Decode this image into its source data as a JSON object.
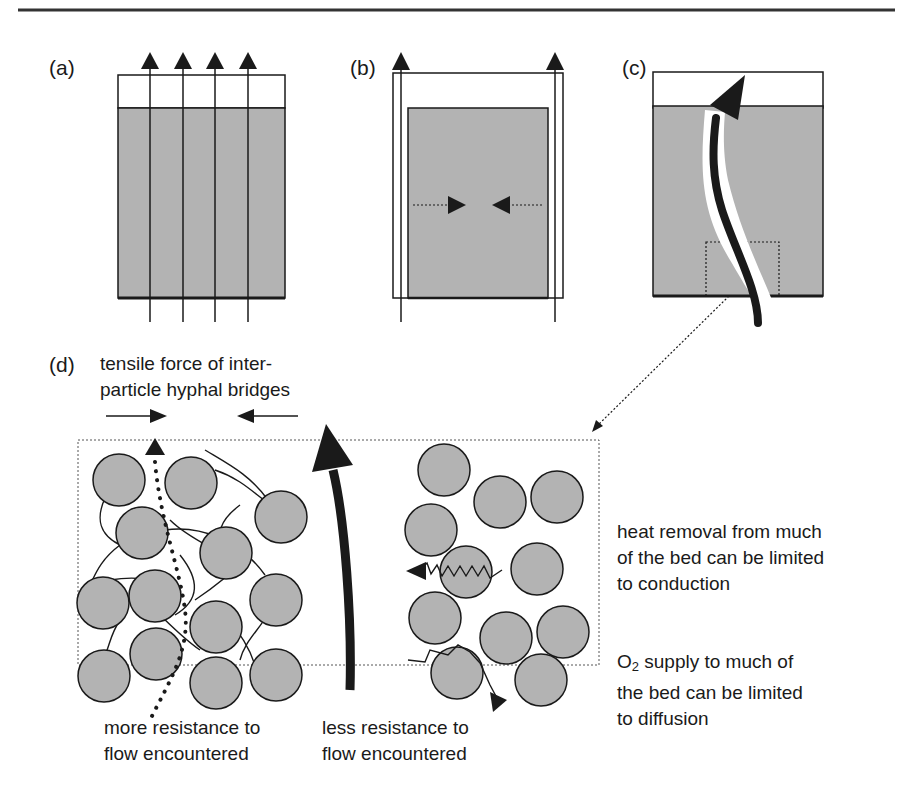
{
  "figure": {
    "panels": [
      {
        "id": "a",
        "label": "(a)"
      },
      {
        "id": "b",
        "label": "(b)"
      },
      {
        "id": "c",
        "label": "(c)"
      },
      {
        "id": "d",
        "label": "(d)"
      }
    ],
    "annotations": {
      "tensile_line1": "tensile force of inter-",
      "tensile_line2": "particle hyphal bridges",
      "heat_line1": "heat removal from  much",
      "heat_line2": "of the bed can be limited",
      "heat_line3": "to conduction",
      "o2_prefix": "O",
      "o2_subscript": "2",
      "o2_line1_rest": " supply to much of",
      "o2_line2": "the bed can be limited",
      "o2_line3": "to diffusion",
      "more_line1": "more resistance to",
      "more_line2": "flow encountered",
      "less_line1": "less resistance to",
      "less_line2": "flow encountered"
    },
    "colors": {
      "bed_fill": "#b3b3b3",
      "stroke": "#1a1a1a",
      "rule": "#333333"
    }
  }
}
